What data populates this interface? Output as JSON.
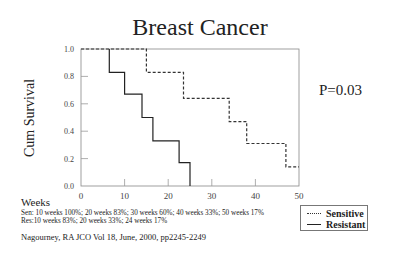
{
  "chart_data": {
    "type": "line",
    "subtype": "kaplan-meier step",
    "title": "Breast Cancer",
    "xlabel": "Weeks",
    "ylabel": "Cum Survival",
    "xlim": [
      0,
      50
    ],
    "ylim": [
      0,
      1.0
    ],
    "x_ticks": [
      "0",
      "10",
      "20",
      "30",
      "40",
      "50"
    ],
    "y_ticks": [
      "0.0",
      "0.2",
      "0.4",
      "0.6",
      "0.8",
      "1.0"
    ],
    "grid": false,
    "legend_position": "bottom-right",
    "annotation": "P=0.03",
    "series": [
      {
        "name": "Sensitive",
        "style": "dashed",
        "x": [
          0,
          15,
          15,
          23.5,
          23.5,
          34,
          34,
          38,
          38,
          47,
          47,
          50
        ],
        "y": [
          1.0,
          1.0,
          0.83,
          0.83,
          0.64,
          0.64,
          0.47,
          0.47,
          0.31,
          0.31,
          0.14,
          0.14
        ]
      },
      {
        "name": "Resistant",
        "style": "solid",
        "x": [
          6.5,
          6.5,
          10,
          10,
          14,
          14,
          16.5,
          16.5,
          22.5,
          22.5,
          25,
          25
        ],
        "y": [
          1.0,
          0.83,
          0.83,
          0.67,
          0.67,
          0.5,
          0.5,
          0.33,
          0.33,
          0.17,
          0.17,
          0.0
        ]
      }
    ]
  },
  "title": "Breast Cancer",
  "ylabel": "Cum Survival",
  "pvalue": "P=0.03",
  "xlabel": "Weeks",
  "notes": {
    "sen": "Sen: 10 weeks 100%; 20 weeks 83%; 30 weeks 60%; 40 weeks 33%; 50 weeks 17%",
    "res": "Res:10 weeks 83%; 20 weeks 33%; 24 weeks 17%"
  },
  "legend": {
    "sensitive": "Sensitive",
    "resistant": "Resistant"
  },
  "citation": "Nagourney, RA JCO Vol 18, June, 2000, pp2245-2249"
}
